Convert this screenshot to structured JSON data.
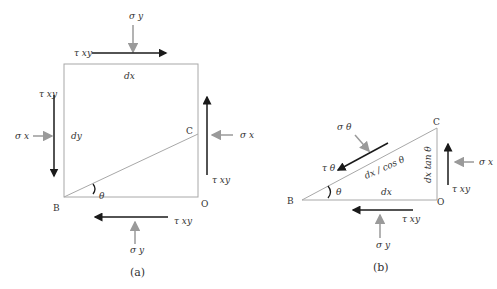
{
  "figure_a": {
    "caption": "(a)",
    "labels": {
      "sigma_y_top": "σ y",
      "tau_xy_top": "τ xy",
      "dx": "dx",
      "tau_xy_left": "τ xy",
      "sigma_x_left": "σ x",
      "dy": "dy",
      "point_c": "C",
      "sigma_x_right": "σ x",
      "tau_xy_right": "τ xy",
      "point_b": "B",
      "theta": "θ",
      "point_o": "O",
      "tau_xy_bottom": "τ xy",
      "sigma_y_bottom": "σ y"
    }
  },
  "figure_b": {
    "caption": "(b)",
    "labels": {
      "point_c": "C",
      "sigma_theta": "σ θ",
      "tau_theta": "τ θ",
      "hypotenuse": "dx / cos θ",
      "vertical_side": "dx tan θ",
      "sigma_x": "σ x",
      "tau_xy_right": "τ xy",
      "point_b": "B",
      "theta": "θ",
      "dx": "dx",
      "point_o": "O",
      "tau_xy_bottom": "τ xy",
      "sigma_y": "σ y"
    }
  },
  "colors": {
    "outline": "#a8a8a8",
    "shear_arrow": "#1a1a1a",
    "normal_arrow": "#9a9a9a"
  }
}
